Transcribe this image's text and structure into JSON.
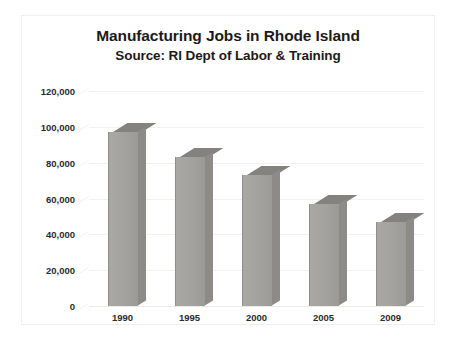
{
  "chart_data": {
    "type": "bar",
    "title": "Manufacturing Jobs in Rhode Island",
    "subtitle": "Source: RI Dept of Labor & Training",
    "categories": [
      "1990",
      "1995",
      "2000",
      "2005",
      "2009"
    ],
    "values": [
      97000,
      83000,
      73000,
      57000,
      47000
    ],
    "series": [
      {
        "name": "Manufacturing Jobs",
        "values": [
          97000,
          83000,
          73000,
          57000,
          47000
        ]
      }
    ],
    "xlabel": "",
    "ylabel": "",
    "ylim": [
      0,
      120000
    ],
    "ytick_values": [
      0,
      20000,
      40000,
      60000,
      80000,
      100000,
      120000
    ],
    "ytick_labels": [
      "0",
      "20,000",
      "40,000",
      "60,000",
      "80,000",
      "100,000",
      "120,000"
    ],
    "grid": true,
    "legend": false,
    "legend_position": "none",
    "style": "3d-column",
    "colors": {
      "bar_front": "#a3a29e",
      "bar_side": "#8c8b87",
      "bar_top": "#83827e",
      "gridline": "#f2f1ee",
      "text": "#1b1b1b",
      "background": "#ffffff",
      "border": "#efefef"
    }
  }
}
